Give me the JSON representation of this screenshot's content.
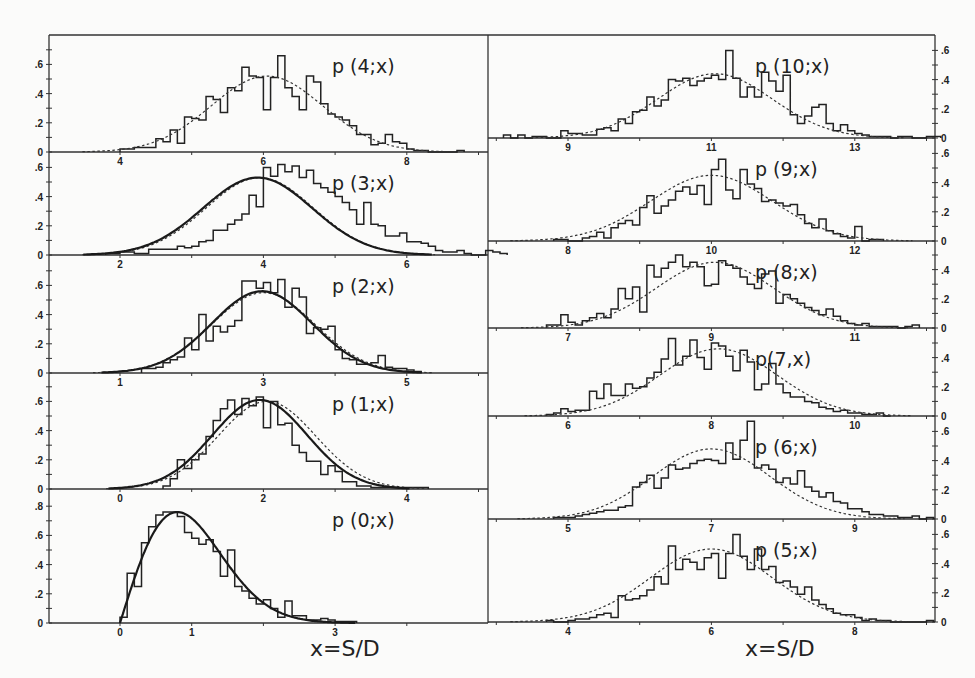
{
  "figure": {
    "x_axis_title_left": "x=S/D",
    "x_axis_title_right": "x=S/D"
  },
  "chart_data": [
    {
      "id": "p4",
      "type": "bar",
      "title": "p (4;x)",
      "column": "left",
      "xlabel": "x=S/D",
      "ylabel": "",
      "xticks_labeled": [
        4,
        6,
        8
      ],
      "yticks": [
        0,
        0.2,
        0.4,
        0.6
      ],
      "xlim": [
        3,
        9
      ],
      "ylim": [
        0,
        0.75
      ],
      "fit_dashed": {
        "mean": 6.05,
        "sigma": 0.78,
        "peak": 0.52
      },
      "fit_solid": null,
      "hist": {
        "start": 4.0,
        "width": 0.1,
        "values": [
          0.02,
          0.02,
          0.03,
          0.03,
          0.03,
          0.09,
          0.07,
          0.15,
          0.06,
          0.24,
          0.23,
          0.22,
          0.38,
          0.36,
          0.27,
          0.44,
          0.42,
          0.58,
          0.52,
          0.51,
          0.29,
          0.51,
          0.66,
          0.44,
          0.38,
          0.29,
          0.52,
          0.48,
          0.33,
          0.26,
          0.24,
          0.22,
          0.18,
          0.12,
          0.12,
          0.05,
          0.06,
          0.12,
          0.07,
          0.06,
          0.02,
          0.01,
          0.01,
          0.0,
          0.0,
          0.0,
          0.0,
          0.01
        ]
      }
    },
    {
      "id": "p3",
      "type": "bar",
      "title": "p (3;x)",
      "column": "left",
      "xlabel": "",
      "ylabel": "",
      "xticks_labeled": [
        2,
        4,
        6
      ],
      "yticks": [
        0,
        0.2,
        0.4,
        0.6
      ],
      "xlim": [
        1,
        7
      ],
      "ylim": [
        0,
        0.65
      ],
      "fit_dashed": {
        "mean": 3.95,
        "sigma": 0.75,
        "peak": 0.53
      },
      "fit_solid": {
        "mean": 3.92,
        "sigma": 0.76,
        "peak": 0.53
      },
      "hist": {
        "start": 1.8,
        "width": 0.1,
        "values": [
          0.01,
          0.01,
          0.02,
          0.02,
          0.01,
          0.01,
          0.04,
          0.04,
          0.04,
          0.04,
          0.06,
          0.05,
          0.06,
          0.09,
          0.1,
          0.17,
          0.17,
          0.21,
          0.24,
          0.28,
          0.41,
          0.33,
          0.6,
          0.54,
          0.62,
          0.57,
          0.61,
          0.53,
          0.58,
          0.49,
          0.46,
          0.43,
          0.4,
          0.36,
          0.31,
          0.21,
          0.36,
          0.21,
          0.2,
          0.13,
          0.13,
          0.15,
          0.09,
          0.09,
          0.08,
          0.06,
          0.03,
          0.02,
          0.02,
          0.03,
          0.01,
          0.0,
          0.0,
          0.03,
          0.02,
          0.01
        ]
      }
    },
    {
      "id": "p2",
      "type": "bar",
      "title": "p (2;x)",
      "column": "left",
      "xlabel": "",
      "ylabel": "",
      "xticks_labeled": [
        1,
        3,
        5
      ],
      "yticks": [
        0,
        0.2,
        0.4,
        0.6
      ],
      "xlim": [
        0,
        6
      ],
      "ylim": [
        0,
        0.7
      ],
      "fit_dashed": {
        "mean": 3.0,
        "sigma": 0.72,
        "peak": 0.55
      },
      "fit_solid": {
        "mean": 2.98,
        "sigma": 0.7,
        "peak": 0.56
      },
      "hist": {
        "start": 1.3,
        "width": 0.1,
        "values": [
          0.03,
          0.03,
          0.04,
          0.07,
          0.09,
          0.11,
          0.24,
          0.16,
          0.4,
          0.22,
          0.32,
          0.28,
          0.32,
          0.36,
          0.63,
          0.63,
          0.58,
          0.62,
          0.55,
          0.64,
          0.45,
          0.58,
          0.52,
          0.27,
          0.31,
          0.3,
          0.32,
          0.16,
          0.1,
          0.09,
          0.06,
          0.06,
          0.07,
          0.12,
          0.04,
          0.03,
          0.03,
          0.02,
          0.01
        ]
      }
    },
    {
      "id": "p1",
      "type": "bar",
      "title": "p (1;x)",
      "column": "left",
      "xlabel": "",
      "ylabel": "",
      "xticks_labeled": [
        0,
        2,
        4
      ],
      "yticks": [
        0,
        0.2,
        0.4,
        0.6
      ],
      "xlim": [
        -1,
        5
      ],
      "ylim": [
        0,
        0.7
      ],
      "fit_dashed": {
        "mean": 2.05,
        "sigma": 0.68,
        "peak": 0.6
      },
      "fit_solid": {
        "mean": 1.95,
        "sigma": 0.66,
        "peak": 0.61
      },
      "hist": {
        "start": 0.6,
        "width": 0.1,
        "values": [
          0.02,
          0.07,
          0.2,
          0.14,
          0.2,
          0.24,
          0.36,
          0.47,
          0.55,
          0.61,
          0.51,
          0.62,
          0.57,
          0.63,
          0.42,
          0.6,
          0.44,
          0.45,
          0.3,
          0.25,
          0.19,
          0.19,
          0.1,
          0.16,
          0.12,
          0.05,
          0.05,
          0.02,
          0.02,
          0.01,
          0.01,
          0.01,
          0.01,
          0.01,
          0.01,
          0.01,
          0.01
        ]
      }
    },
    {
      "id": "p0",
      "type": "bar",
      "title": "p (0;x)",
      "column": "left",
      "xlabel": "x=S/D",
      "ylabel": "",
      "xticks_labeled": [
        0,
        1,
        3
      ],
      "yticks": [
        0,
        0.2,
        0.4,
        0.6,
        0.8
      ],
      "xlim": [
        -2,
        4
      ],
      "ylim": [
        0,
        0.85
      ],
      "fit_dashed": null,
      "fit_solid": {
        "type": "wigner_like",
        "peak_x": 0.8,
        "peak": 0.76
      },
      "hist": {
        "start": 0.0,
        "width": 0.1,
        "values": [
          0.04,
          0.34,
          0.25,
          0.55,
          0.66,
          0.74,
          0.76,
          0.76,
          0.73,
          0.62,
          0.58,
          0.54,
          0.57,
          0.49,
          0.32,
          0.5,
          0.25,
          0.22,
          0.17,
          0.13,
          0.16,
          0.1,
          0.04,
          0.15,
          0.05,
          0.05,
          0.02,
          0.02,
          0.03,
          0.02,
          0.01,
          0.01,
          0.01
        ]
      }
    },
    {
      "id": "p10",
      "type": "bar",
      "title": "p (10;x)",
      "column": "right",
      "xlabel": "",
      "ylabel": "",
      "xticks_labeled": [
        9,
        11,
        13
      ],
      "yticks": [
        0,
        0.2,
        0.4,
        0.6
      ],
      "xlim": [
        8,
        14
      ],
      "ylim": [
        0,
        0.7
      ],
      "fit_dashed": {
        "mean": 11.05,
        "sigma": 0.8,
        "peak": 0.44
      },
      "fit_solid": null,
      "hist": {
        "start": 8.1,
        "width": 0.1,
        "values": [
          0.02,
          0.0,
          0.02,
          0.0,
          0.01,
          0.01,
          0.0,
          0.0,
          0.05,
          0.03,
          0.03,
          0.02,
          0.02,
          0.06,
          0.07,
          0.05,
          0.13,
          0.1,
          0.18,
          0.19,
          0.28,
          0.22,
          0.26,
          0.4,
          0.39,
          0.41,
          0.36,
          0.39,
          0.41,
          0.43,
          0.4,
          0.6,
          0.41,
          0.28,
          0.35,
          0.28,
          0.45,
          0.39,
          0.32,
          0.43,
          0.16,
          0.1,
          0.15,
          0.21,
          0.23,
          0.1,
          0.05,
          0.09,
          0.05,
          0.03,
          0.02,
          0.01,
          0.01,
          0.01,
          0.0,
          0.01,
          0.01,
          0.0,
          0.0,
          0.01,
          0.01
        ]
      }
    },
    {
      "id": "p9",
      "type": "bar",
      "title": "p (9;x)",
      "column": "right",
      "xlabel": "",
      "ylabel": "",
      "xticks_labeled": [
        8,
        10,
        12
      ],
      "yticks": [
        0,
        0.2,
        0.4,
        0.6
      ],
      "xlim": [
        7,
        13
      ],
      "ylim": [
        0,
        0.7
      ],
      "fit_dashed": {
        "mean": 10.0,
        "sigma": 0.85,
        "peak": 0.45
      },
      "fit_solid": null,
      "hist": {
        "start": 7.8,
        "width": 0.1,
        "values": [
          0.01,
          0.01,
          0.0,
          0.0,
          0.02,
          0.03,
          0.06,
          0.02,
          0.09,
          0.12,
          0.14,
          0.11,
          0.23,
          0.31,
          0.19,
          0.24,
          0.28,
          0.34,
          0.37,
          0.32,
          0.38,
          0.25,
          0.49,
          0.56,
          0.35,
          0.29,
          0.49,
          0.39,
          0.36,
          0.27,
          0.28,
          0.26,
          0.24,
          0.25,
          0.18,
          0.12,
          0.09,
          0.15,
          0.07,
          0.05,
          0.03,
          0.02,
          0.1,
          0.0,
          0.01,
          0.01
        ]
      }
    },
    {
      "id": "p8",
      "type": "bar",
      "title": "p (8;x)",
      "column": "right",
      "xlabel": "",
      "ylabel": "",
      "xticks_labeled": [
        7,
        9,
        11
      ],
      "yticks": [
        0,
        0.2,
        0.4
      ],
      "xlim": [
        6,
        12
      ],
      "ylim": [
        0,
        0.55
      ],
      "fit_dashed": {
        "mean": 9.05,
        "sigma": 0.82,
        "peak": 0.45
      },
      "fit_solid": null,
      "hist": {
        "start": 6.7,
        "width": 0.1,
        "values": [
          0.02,
          0.02,
          0.09,
          0.04,
          0.02,
          0.05,
          0.07,
          0.1,
          0.07,
          0.13,
          0.27,
          0.2,
          0.28,
          0.11,
          0.43,
          0.35,
          0.41,
          0.45,
          0.5,
          0.42,
          0.45,
          0.42,
          0.29,
          0.3,
          0.46,
          0.43,
          0.41,
          0.35,
          0.3,
          0.27,
          0.37,
          0.39,
          0.17,
          0.23,
          0.2,
          0.17,
          0.14,
          0.12,
          0.09,
          0.13,
          0.08,
          0.05,
          0.03,
          0.02,
          0.03,
          0.01,
          0.01,
          0.01,
          0.01,
          0.0,
          0.01,
          0.02
        ]
      }
    },
    {
      "id": "p7",
      "type": "bar",
      "title": "p(7,x)",
      "column": "right",
      "xlabel": "",
      "ylabel": "",
      "xticks_labeled": [
        6,
        8,
        10
      ],
      "yticks": [
        0,
        0.2,
        0.4
      ],
      "xlim": [
        5,
        11
      ],
      "ylim": [
        0,
        0.55
      ],
      "fit_dashed": {
        "mean": 8.1,
        "sigma": 0.82,
        "peak": 0.46
      },
      "fit_solid": null,
      "hist": {
        "start": 5.7,
        "width": 0.1,
        "values": [
          0.01,
          0.02,
          0.05,
          0.03,
          0.04,
          0.04,
          0.17,
          0.12,
          0.22,
          0.14,
          0.14,
          0.22,
          0.19,
          0.2,
          0.26,
          0.3,
          0.39,
          0.53,
          0.35,
          0.41,
          0.52,
          0.4,
          0.32,
          0.5,
          0.48,
          0.41,
          0.31,
          0.45,
          0.37,
          0.18,
          0.22,
          0.36,
          0.22,
          0.16,
          0.13,
          0.13,
          0.1,
          0.09,
          0.06,
          0.05,
          0.03,
          0.04,
          0.02,
          0.02,
          0.01,
          0.01,
          0.02,
          0.0
        ]
      }
    },
    {
      "id": "p6",
      "type": "bar",
      "title": "p (6;x)",
      "column": "right",
      "xlabel": "",
      "ylabel": "",
      "xticks_labeled": [
        5,
        7,
        9
      ],
      "yticks": [
        0,
        0.2,
        0.4,
        0.6
      ],
      "xlim": [
        4,
        10
      ],
      "ylim": [
        0,
        0.7
      ],
      "fit_dashed": {
        "mean": 7.0,
        "sigma": 0.82,
        "peak": 0.48
      },
      "fit_solid": null,
      "hist": {
        "start": 4.8,
        "width": 0.1,
        "values": [
          0.01,
          0.01,
          0.01,
          0.02,
          0.03,
          0.04,
          0.05,
          0.06,
          0.06,
          0.08,
          0.09,
          0.22,
          0.25,
          0.3,
          0.21,
          0.28,
          0.37,
          0.34,
          0.35,
          0.38,
          0.4,
          0.41,
          0.4,
          0.38,
          0.52,
          0.41,
          0.54,
          0.67,
          0.35,
          0.37,
          0.34,
          0.25,
          0.28,
          0.24,
          0.33,
          0.22,
          0.19,
          0.15,
          0.18,
          0.12,
          0.11,
          0.07,
          0.07,
          0.05,
          0.03,
          0.03,
          0.02,
          0.02,
          0.01,
          0.01,
          0.02,
          0.0,
          0.01
        ]
      }
    },
    {
      "id": "p5",
      "type": "bar",
      "title": "p (5;x)",
      "column": "right",
      "xlabel": "x=S/D",
      "ylabel": "",
      "xticks_labeled": [
        4,
        6,
        8
      ],
      "yticks": [
        0,
        0.2,
        0.4,
        0.6
      ],
      "xlim": [
        3,
        9
      ],
      "ylim": [
        0,
        0.65
      ],
      "fit_dashed": {
        "mean": 6.0,
        "sigma": 0.85,
        "peak": 0.5
      },
      "fit_solid": null,
      "hist": {
        "start": 3.7,
        "width": 0.1,
        "values": [
          0.01,
          0.0,
          0.0,
          0.01,
          0.02,
          0.02,
          0.03,
          0.05,
          0.06,
          0.03,
          0.18,
          0.15,
          0.16,
          0.18,
          0.22,
          0.31,
          0.26,
          0.52,
          0.36,
          0.43,
          0.41,
          0.36,
          0.44,
          0.47,
          0.3,
          0.47,
          0.6,
          0.45,
          0.36,
          0.5,
          0.36,
          0.38,
          0.27,
          0.28,
          0.24,
          0.19,
          0.24,
          0.15,
          0.12,
          0.09,
          0.06,
          0.05,
          0.05,
          0.03,
          0.01,
          0.02,
          0.01,
          0.01,
          0.0,
          0.0,
          0.0,
          0.0,
          0.0,
          0.01
        ]
      }
    }
  ]
}
